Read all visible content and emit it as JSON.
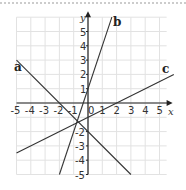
{
  "chart_data": {
    "type": "line",
    "title": "",
    "xlabel": "x",
    "ylabel": "y",
    "xlim": [
      -5,
      5.5
    ],
    "ylim": [
      -5,
      6
    ],
    "grid": true,
    "x_ticks": [
      "-5",
      "-4",
      "-3",
      "-2",
      "-1",
      "0",
      "1",
      "2",
      "3",
      "4",
      "5"
    ],
    "y_ticks": [
      "5",
      "4",
      "3",
      "2",
      "1",
      "-2",
      "-3",
      "-4",
      "-5"
    ],
    "series": [
      {
        "name": "a",
        "equation": "y = -x - 2",
        "slope": -1,
        "intercept": -2,
        "x": [
          -5,
          3
        ],
        "y": [
          3,
          -5
        ]
      },
      {
        "name": "b",
        "equation": "y = 3x + 1",
        "slope": 3,
        "intercept": 1,
        "x": [
          -2,
          1.67
        ],
        "y": [
          -5,
          6
        ]
      },
      {
        "name": "c",
        "equation": "y = 0.5x - 1",
        "slope": 0.5,
        "intercept": -1,
        "x": [
          -5,
          6
        ],
        "y": [
          -3.5,
          2
        ]
      }
    ]
  },
  "labels": {
    "a": "a",
    "b": "b",
    "c": "c",
    "x": "x",
    "y": "y",
    "origin": "0"
  }
}
